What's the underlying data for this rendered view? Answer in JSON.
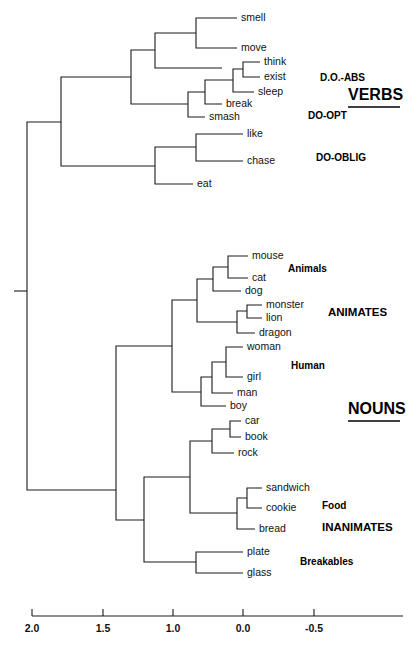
{
  "chart_data": {
    "type": "dendrogram",
    "title": "",
    "xlabel": "",
    "ylabel": "",
    "grid": false,
    "legend_position": "inline-right",
    "axis": {
      "tick_labels": [
        "2.0",
        "1.5",
        "1.0",
        "0.0",
        "-0.5"
      ],
      "tick_values": [
        2.0,
        1.5,
        1.0,
        0.0,
        -0.5
      ],
      "tick_x_px": [
        32,
        103,
        173,
        243,
        314
      ],
      "axis_y_px": 616,
      "axis_x_start_px": 32,
      "axis_x_end_px": 403,
      "tick_label_y_px": 632,
      "direction": "decreasing-left-to-right"
    },
    "leaves": [
      {
        "name": "smell",
        "y": 18,
        "x": 237
      },
      {
        "name": "move",
        "y": 48,
        "x": 237
      },
      {
        "name": "think",
        "y": 62,
        "x": 260
      },
      {
        "name": "exist",
        "y": 77,
        "x": 260
      },
      {
        "name": "sleep",
        "y": 92,
        "x": 254
      },
      {
        "name": "break",
        "y": 104,
        "x": 222
      },
      {
        "name": "smash",
        "y": 117,
        "x": 205
      },
      {
        "name": "like",
        "y": 134,
        "x": 243
      },
      {
        "name": "chase",
        "y": 161,
        "x": 243
      },
      {
        "name": "eat",
        "y": 184,
        "x": 193
      },
      {
        "name": "mouse",
        "y": 256,
        "x": 248
      },
      {
        "name": "cat",
        "y": 278,
        "x": 248
      },
      {
        "name": "dog",
        "y": 291,
        "x": 241
      },
      {
        "name": "monster",
        "y": 305,
        "x": 262
      },
      {
        "name": "lion",
        "y": 318,
        "x": 262
      },
      {
        "name": "dragon",
        "y": 333,
        "x": 255
      },
      {
        "name": "woman",
        "y": 347,
        "x": 243
      },
      {
        "name": "girl",
        "y": 377,
        "x": 243
      },
      {
        "name": "man",
        "y": 393,
        "x": 233
      },
      {
        "name": "boy",
        "y": 406,
        "x": 226
      },
      {
        "name": "car",
        "y": 421,
        "x": 241
      },
      {
        "name": "book",
        "y": 437,
        "x": 241
      },
      {
        "name": "rock",
        "y": 453,
        "x": 234
      },
      {
        "name": "sandwich",
        "y": 488,
        "x": 262
      },
      {
        "name": "cookie",
        "y": 508,
        "x": 262
      },
      {
        "name": "bread",
        "y": 529,
        "x": 255
      },
      {
        "name": "plate",
        "y": 552,
        "x": 243
      },
      {
        "name": "glass",
        "y": 573,
        "x": 243
      }
    ],
    "links": [
      {
        "id": "smell-move",
        "x": 196,
        "y1": 18,
        "y2": 48,
        "x_left_1": 237,
        "x_left_2": 237
      },
      {
        "id": "see-join",
        "x": 155,
        "y1": 33,
        "y2": 68,
        "x_left_1": 196,
        "x_left_2": 222
      },
      {
        "id": "think-exist",
        "x": 243,
        "y1": 62,
        "y2": 77,
        "x_left_1": 260,
        "x_left_2": 260
      },
      {
        "id": "te-sleep",
        "x": 233,
        "y1": 69,
        "y2": 92,
        "x_left_1": 243,
        "x_left_2": 254
      },
      {
        "id": "tes-break",
        "x": 205,
        "y1": 80,
        "y2": 104,
        "x_left_1": 233,
        "x_left_2": 222
      },
      {
        "id": "tesb-smash",
        "x": 188,
        "y1": 92,
        "y2": 117,
        "x_left_1": 205,
        "x_left_2": 205
      },
      {
        "id": "verbtop",
        "x": 131,
        "y1": 50,
        "y2": 104,
        "x_left_1": 155,
        "x_left_2": 188
      },
      {
        "id": "like-chase",
        "x": 196,
        "y1": 134,
        "y2": 161,
        "x_left_1": 243,
        "x_left_2": 243
      },
      {
        "id": "lc-eat",
        "x": 155,
        "y1": 147,
        "y2": 184,
        "x_left_1": 196,
        "x_left_2": 193
      },
      {
        "id": "verbs-root",
        "x": 61,
        "y1": 77,
        "y2": 166,
        "x_left_1": 131,
        "x_left_2": 155
      },
      {
        "id": "mouse-cat",
        "x": 228,
        "y1": 256,
        "y2": 278,
        "x_left_1": 248,
        "x_left_2": 248
      },
      {
        "id": "mc-dog",
        "x": 213,
        "y1": 267,
        "y2": 291,
        "x_left_1": 228,
        "x_left_2": 241
      },
      {
        "id": "mons-lion",
        "x": 247,
        "y1": 305,
        "y2": 318,
        "x_left_1": 262,
        "x_left_2": 262
      },
      {
        "id": "ml-dragon",
        "x": 237,
        "y1": 311,
        "y2": 333,
        "x_left_1": 247,
        "x_left_2": 255
      },
      {
        "id": "animals",
        "x": 197,
        "y1": 279,
        "y2": 322,
        "x_left_1": 213,
        "x_left_2": 237
      },
      {
        "id": "woman-girl",
        "x": 226,
        "y1": 347,
        "y2": 377,
        "x_left_1": 243,
        "x_left_2": 243
      },
      {
        "id": "wg-man",
        "x": 212,
        "y1": 362,
        "y2": 393,
        "x_left_1": 226,
        "x_left_2": 233
      },
      {
        "id": "wgm-boy",
        "x": 201,
        "y1": 377,
        "y2": 406,
        "x_left_1": 212,
        "x_left_2": 226
      },
      {
        "id": "human-join",
        "x": 172,
        "y1": 300,
        "y2": 392,
        "x_left_1": 197,
        "x_left_2": 201
      },
      {
        "id": "car-book",
        "x": 230,
        "y1": 421,
        "y2": 437,
        "x_left_1": 241,
        "x_left_2": 241
      },
      {
        "id": "cb-rock",
        "x": 212,
        "y1": 429,
        "y2": 453,
        "x_left_1": 230,
        "x_left_2": 234
      },
      {
        "id": "sand-cook",
        "x": 247,
        "y1": 488,
        "y2": 508,
        "x_left_1": 262,
        "x_left_2": 262
      },
      {
        "id": "sc-bread",
        "x": 237,
        "y1": 498,
        "y2": 529,
        "x_left_1": 247,
        "x_left_2": 255
      },
      {
        "id": "obj-food",
        "x": 190,
        "y1": 441,
        "y2": 513,
        "x_left_1": 212,
        "x_left_2": 237
      },
      {
        "id": "plate-glass",
        "x": 196,
        "y1": 552,
        "y2": 573,
        "x_left_1": 243,
        "x_left_2": 243
      },
      {
        "id": "inanimates",
        "x": 144,
        "y1": 477,
        "y2": 562,
        "x_left_1": 190,
        "x_left_2": 196
      },
      {
        "id": "nouns-join",
        "x": 116,
        "y1": 346,
        "y2": 520,
        "x_left_1": 172,
        "x_left_2": 144
      },
      {
        "id": "root",
        "x": 27,
        "y1": 122,
        "y2": 490,
        "x_left_1": 61,
        "x_left_2": 116
      }
    ],
    "root_stub": {
      "x1": 14,
      "x2": 27,
      "y": 291
    },
    "group_labels": [
      {
        "text": "D.O.-ABS",
        "x": 320,
        "y": 78,
        "size": "small",
        "underline": false,
        "anchor": "start"
      },
      {
        "text": "VERBS",
        "x": 348,
        "y": 96,
        "size": "large",
        "underline": true,
        "anchor": "start"
      },
      {
        "text": "DO-OPT",
        "x": 308,
        "y": 116,
        "size": "small",
        "underline": false,
        "anchor": "start"
      },
      {
        "text": "DO-OBLIG",
        "x": 316,
        "y": 158,
        "size": "small",
        "underline": false,
        "anchor": "start"
      },
      {
        "text": "Animals",
        "x": 288,
        "y": 269,
        "size": "small",
        "underline": false,
        "anchor": "start"
      },
      {
        "text": "ANIMATES",
        "x": 328,
        "y": 313,
        "size": "medium",
        "underline": false,
        "anchor": "start"
      },
      {
        "text": "Human",
        "x": 291,
        "y": 366,
        "size": "small",
        "underline": false,
        "anchor": "start"
      },
      {
        "text": "NOUNS",
        "x": 348,
        "y": 410,
        "size": "large",
        "underline": true,
        "anchor": "start"
      },
      {
        "text": "Food",
        "x": 322,
        "y": 506,
        "size": "small",
        "underline": false,
        "anchor": "start"
      },
      {
        "text": "INANIMATES",
        "x": 322,
        "y": 528,
        "size": "medium",
        "underline": false,
        "anchor": "start"
      },
      {
        "text": "Breakables",
        "x": 300,
        "y": 562,
        "size": "small",
        "underline": false,
        "anchor": "start"
      }
    ],
    "colors": {
      "background": "#ffffff",
      "line": "#1a1a1a",
      "text": "#111111",
      "label": "#000000"
    }
  }
}
